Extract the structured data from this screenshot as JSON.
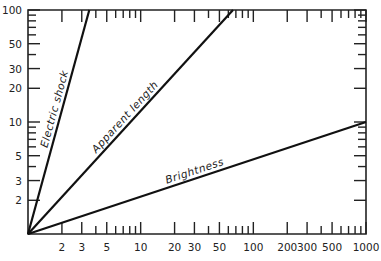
{
  "chart_data": {
    "type": "line",
    "title": "",
    "xlabel": "",
    "ylabel": "",
    "xscale": "log",
    "yscale": "log",
    "xlim": [
      1,
      1000
    ],
    "ylim": [
      1,
      100
    ],
    "grid": false,
    "legend": "inline labels along lines",
    "x_tick_labels": [
      "2",
      "3",
      "5",
      "10",
      "20",
      "30",
      "50",
      "100",
      "200",
      "300",
      "500",
      "1000"
    ],
    "y_tick_labels": [
      "2",
      "3",
      "5",
      "10",
      "20",
      "30",
      "50",
      "100"
    ],
    "series": [
      {
        "name": "Electric shock",
        "x": [
          1,
          3.5
        ],
        "y": [
          1,
          100
        ]
      },
      {
        "name": "Apparent length",
        "x": [
          1,
          66
        ],
        "y": [
          1,
          100
        ]
      },
      {
        "name": "Brightness",
        "x": [
          1,
          1000
        ],
        "y": [
          1,
          10
        ]
      }
    ]
  }
}
